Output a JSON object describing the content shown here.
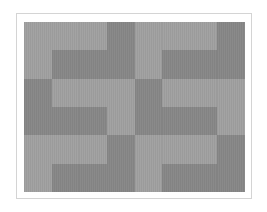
{
  "colors": {
    "light": "#a3a3a3",
    "dark": "#8a8a8a",
    "frame": "#d4d4d4"
  },
  "pattern": {
    "rows": 6,
    "cols": 8,
    "cells": [
      "LLLDLLLD",
      "LDDDLDDD",
      "DLLLDLLL",
      "DDDLDDDL",
      "LLLDLLLD",
      "LDDDLDDD"
    ]
  }
}
